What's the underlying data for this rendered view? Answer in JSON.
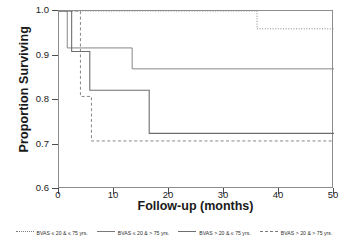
{
  "chart_data": {
    "type": "line",
    "title": "",
    "xlabel": "Follow-up (months)",
    "ylabel": "Proportion Surviving",
    "xlim": [
      0,
      50
    ],
    "ylim": [
      0.6,
      1.0
    ],
    "xticks": [
      0,
      10,
      20,
      30,
      40,
      50
    ],
    "xtick_labels": [
      "0",
      "10",
      "20",
      "30",
      "40",
      "50"
    ],
    "yticks": [
      0.6,
      0.7,
      0.8,
      0.9,
      1.0
    ],
    "ytick_labels": [
      "0.6",
      "0.7",
      "0.8",
      "0.9",
      "1.0"
    ],
    "grid": false,
    "legend_position": "below",
    "step_style": "post",
    "series": [
      {
        "name": "BVAS ≤ 20 & ≤ 75 yrs.",
        "linestyle": "dotted",
        "color": "#7a7a7a",
        "x": [
          0,
          36,
          50
        ],
        "y": [
          1.0,
          0.96,
          0.96
        ]
      },
      {
        "name": "BVAS ≤ 20 & > 75 yrs.",
        "linestyle": "solid-thin",
        "color": "#7a7a7a",
        "x": [
          0,
          1.5,
          13.3,
          50
        ],
        "y": [
          1.0,
          0.917,
          0.87,
          0.87
        ]
      },
      {
        "name": "BVAS > 20 & ≤ 75 yrs.",
        "linestyle": "solid",
        "color": "#6e6e6e",
        "x": [
          0,
          2.3,
          5.6,
          16.4,
          50
        ],
        "y": [
          1.0,
          0.909,
          0.822,
          0.725,
          0.725
        ]
      },
      {
        "name": "BVAS > 20 & > 75 yrs.",
        "linestyle": "dashed",
        "color": "#7a7a7a",
        "x": [
          0,
          3.9,
          5.9,
          50
        ],
        "y": [
          1.0,
          0.808,
          0.708,
          0.708
        ]
      }
    ]
  },
  "axes": {
    "xlabel": "Follow-up (months)",
    "ylabel": "Proportion Surviving"
  },
  "legend": {
    "items": [
      {
        "label": "BVAS ≤ 20 & ≤ 75 yrs.",
        "style": "dotted"
      },
      {
        "label": "BVAS ≤ 20 & > 75 yrs.",
        "style": "solid-thin"
      },
      {
        "label": "BVAS > 20 & ≤ 75 yrs.",
        "style": "solid"
      },
      {
        "label": "BVAS > 20 & > 75 yrs.",
        "style": "dashed"
      }
    ]
  }
}
